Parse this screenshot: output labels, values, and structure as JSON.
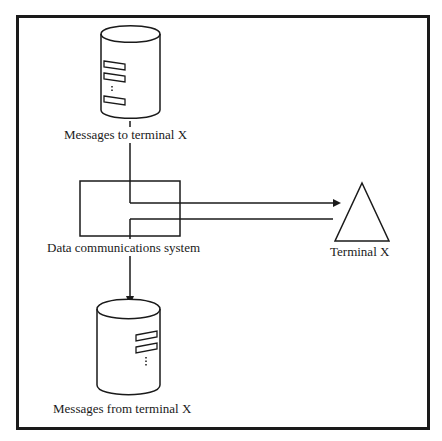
{
  "diagram": {
    "nodes": [
      {
        "id": "db_to",
        "shape": "cylinder",
        "label": "Messages to terminal X"
      },
      {
        "id": "dcs",
        "shape": "rectangle",
        "label": "Data communications system"
      },
      {
        "id": "terminal",
        "shape": "triangle",
        "label": "Terminal X"
      },
      {
        "id": "db_from",
        "shape": "cylinder",
        "label": "Messages from terminal X"
      }
    ],
    "edges": [
      {
        "from": "db_to",
        "to": "terminal",
        "via": "dcs",
        "arrow": "end"
      },
      {
        "from": "terminal",
        "to": "db_from",
        "via": "dcs",
        "arrow": "end"
      }
    ],
    "colors": {
      "stroke": "#1a1a1a",
      "background": "#ffffff"
    }
  }
}
